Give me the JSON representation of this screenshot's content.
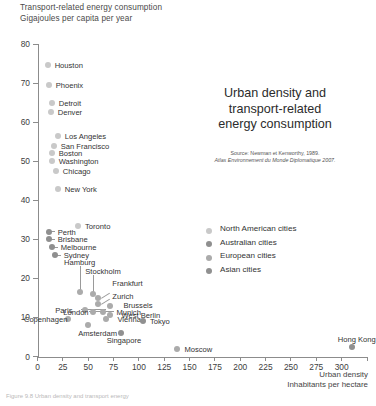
{
  "header": {
    "y_axis_title_line1": "Transport-related energy consumption",
    "y_axis_title_line2": "Gigajoules per capita per year"
  },
  "title": {
    "line1": "Urban density and",
    "line2": "transport-related",
    "line3": "energy consumption"
  },
  "source": {
    "line1": "Source: Newman et Kenworthy, 1989.",
    "line2": "Atlas Environnement du Monde Diplomatique 2007."
  },
  "axis_title_x": {
    "line1": "Urban density",
    "line2": "Inhabitants per hectare"
  },
  "caption": "Figure 9.8 Urban density and transport energy",
  "legend": {
    "position": "right",
    "items": [
      {
        "label": "North American cities",
        "color": "#c9c9c9"
      },
      {
        "label": "Australian cities",
        "color": "#8f8f8f"
      },
      {
        "label": "European cities",
        "color": "#ababab"
      },
      {
        "label": "Asian cities",
        "color": "#909090"
      }
    ]
  },
  "chart_data": {
    "type": "scatter",
    "title": "Urban density and transport-related energy consumption",
    "xlabel": "Urban density — Inhabitants per hectare",
    "ylabel": "Transport-related energy consumption — Gigajoules per capita per year",
    "xlim": [
      0,
      325
    ],
    "ylim": [
      0,
      80
    ],
    "xticks": [
      0,
      25,
      50,
      75,
      100,
      125,
      150,
      175,
      200,
      225,
      250,
      275,
      300,
      325
    ],
    "xtick_labels": [
      "0",
      "25",
      "50",
      "75",
      "100",
      "125",
      "150",
      "175",
      "200",
      "225",
      "250",
      "275",
      "300",
      ""
    ],
    "yticks": [
      0,
      10,
      20,
      30,
      40,
      50,
      60,
      70,
      80
    ],
    "ytick_labels": [
      "0",
      "10",
      "20",
      "30",
      "40",
      "50",
      "60",
      "70",
      "80"
    ],
    "grid": false,
    "series": [
      {
        "name": "North American cities",
        "color": "#c9c9c9",
        "points": [
          {
            "label": "Houston",
            "x": 10,
            "y": 74.5
          },
          {
            "label": "Phoenix",
            "x": 11,
            "y": 69.5
          },
          {
            "label": "Detroit",
            "x": 14,
            "y": 65.0
          },
          {
            "label": "Denver",
            "x": 13,
            "y": 62.5
          },
          {
            "label": "Los Angeles",
            "x": 20,
            "y": 56.5
          },
          {
            "label": "San Francisco",
            "x": 16,
            "y": 54.0
          },
          {
            "label": "Boston",
            "x": 14,
            "y": 52.0
          },
          {
            "label": "Washington",
            "x": 14,
            "y": 50.0
          },
          {
            "label": "Chicago",
            "x": 18,
            "y": 47.5
          },
          {
            "label": "New York",
            "x": 20,
            "y": 43.0
          },
          {
            "label": "Toronto",
            "x": 40,
            "y": 33.5
          }
        ]
      },
      {
        "name": "Australian cities",
        "color": "#8f8f8f",
        "points": [
          {
            "label": "Perth",
            "x": 11,
            "y": 32.0
          },
          {
            "label": "Brisbane",
            "x": 11,
            "y": 30.0
          },
          {
            "label": "Melbourne",
            "x": 14,
            "y": 28.0
          },
          {
            "label": "Sydney",
            "x": 17,
            "y": 26.0
          }
        ]
      },
      {
        "name": "European cities",
        "color": "#ababab",
        "points": [
          {
            "label": "Hamburg",
            "x": 42,
            "y": 16.5
          },
          {
            "label": "Stockholm",
            "x": 55,
            "y": 16.0
          },
          {
            "label": "Frankfurt",
            "x": 60,
            "y": 15.0
          },
          {
            "label": "Zurich",
            "x": 60,
            "y": 13.5
          },
          {
            "label": "Brussels",
            "x": 72,
            "y": 13.0
          },
          {
            "label": "Paris",
            "x": 47,
            "y": 12.0
          },
          {
            "label": "London",
            "x": 55,
            "y": 11.5
          },
          {
            "label": "Munich",
            "x": 65,
            "y": 11.5
          },
          {
            "label": "West Berlin",
            "x": 72,
            "y": 10.5
          },
          {
            "label": "Vienna",
            "x": 68,
            "y": 9.5
          },
          {
            "label": "Copenhagen",
            "x": 30,
            "y": 9.5
          },
          {
            "label": "Amsterdam",
            "x": 50,
            "y": 8.0
          },
          {
            "label": "Moscow",
            "x": 138,
            "y": 2.0
          }
        ]
      },
      {
        "name": "Asian cities",
        "color": "#909090",
        "points": [
          {
            "label": "Tokyo",
            "x": 104,
            "y": 9.0
          },
          {
            "label": "Singapore",
            "x": 82,
            "y": 6.0
          },
          {
            "label": "Hong Kong",
            "x": 310,
            "y": 2.5
          }
        ]
      }
    ]
  }
}
